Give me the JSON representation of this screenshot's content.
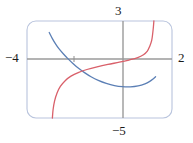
{
  "figure": {
    "width": 193,
    "height": 143,
    "background": "#ffffff",
    "frame": {
      "name": "graphing-calculator-viewport",
      "x": 27,
      "y": 21,
      "width": 145,
      "height": 97,
      "corner_radius": 9,
      "stroke": "#b9c4dd",
      "stroke_width": 1.1
    }
  },
  "axes": {
    "x_axis": {
      "y": 59,
      "stroke": "#9a9a9a",
      "stroke_width": 1.4
    },
    "y_axis": {
      "x": 123,
      "stroke": "#9a9a9a",
      "stroke_width": 1.4
    },
    "tick": {
      "x": 74,
      "y": 59,
      "half_length": 3,
      "stroke": "#8f8f8f"
    }
  },
  "labels": {
    "left": "−4",
    "right": "2",
    "top": "3",
    "bottom": "−5"
  },
  "chart_data": {
    "type": "line",
    "title": "",
    "xlabel": "",
    "ylabel": "",
    "xlim": [
      -4,
      2
    ],
    "ylim": [
      -5,
      3
    ],
    "grid": false,
    "legend": null,
    "window": {
      "xmin": -4,
      "xmax": 2,
      "ymin": -5,
      "ymax": 3
    },
    "tick_marks": {
      "x": [
        -1
      ],
      "y": []
    },
    "series": [
      {
        "name": "blue-curve",
        "color": "#5b7fb5",
        "stroke_width": 1.3,
        "description": "decreasing then increasing curve with minimum below the x-axis",
        "points": [
          [
            -3.08,
            2.05
          ],
          [
            -2.95,
            1.55
          ],
          [
            -2.82,
            1.12
          ],
          [
            -2.68,
            0.72
          ],
          [
            -2.5,
            0.3
          ],
          [
            -2.32,
            -0.08
          ],
          [
            -2.1,
            -0.5
          ],
          [
            -1.88,
            -0.88
          ],
          [
            -1.62,
            -1.26
          ],
          [
            -1.35,
            -1.6
          ],
          [
            -1.05,
            -1.9
          ],
          [
            -0.72,
            -2.15
          ],
          [
            -0.38,
            -2.33
          ],
          [
            -0.05,
            -2.42
          ],
          [
            0.28,
            -2.43
          ],
          [
            0.6,
            -2.35
          ],
          [
            0.88,
            -2.18
          ],
          [
            1.08,
            -1.98
          ],
          [
            1.22,
            -1.78
          ],
          [
            1.32,
            -1.6
          ]
        ]
      },
      {
        "name": "red-curve",
        "color": "#d9606a",
        "stroke_width": 1.3,
        "description": "increasing S-shaped curve rising steeply at both ends",
        "points": [
          [
            -2.95,
            -5.0
          ],
          [
            -2.92,
            -4.3
          ],
          [
            -2.86,
            -3.6
          ],
          [
            -2.76,
            -2.95
          ],
          [
            -2.62,
            -2.4
          ],
          [
            -2.42,
            -1.92
          ],
          [
            -2.18,
            -1.55
          ],
          [
            -1.88,
            -1.25
          ],
          [
            -1.52,
            -1.0
          ],
          [
            -1.1,
            -0.78
          ],
          [
            -0.65,
            -0.58
          ],
          [
            -0.18,
            -0.4
          ],
          [
            0.22,
            -0.22
          ],
          [
            0.58,
            -0.02
          ],
          [
            0.82,
            0.22
          ],
          [
            0.98,
            0.52
          ],
          [
            1.08,
            0.92
          ],
          [
            1.16,
            1.4
          ],
          [
            1.2,
            1.95
          ],
          [
            1.23,
            2.5
          ],
          [
            1.25,
            3.0
          ]
        ]
      }
    ]
  }
}
